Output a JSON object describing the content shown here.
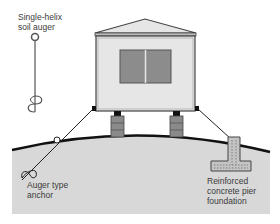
{
  "diagram": {
    "labels": {
      "soil_auger": [
        "Single-helix",
        "soil auger"
      ],
      "auger_anchor": [
        "Auger type",
        "anchor"
      ],
      "pier_foundation": [
        "Reinforced",
        "concrete pier",
        "foundation"
      ]
    },
    "colors": {
      "ground_fill": "#d8d8d8",
      "ground_line": "#111111",
      "house_wall": "#e6e6e6",
      "house_outline": "#444444",
      "window": "#8c8c8c",
      "pier": "#8a8a8a",
      "concrete": "#c4c4c4",
      "tie_line": "#222222"
    }
  }
}
